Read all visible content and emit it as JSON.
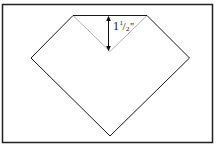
{
  "diagram": {
    "measurement": {
      "whole": "1",
      "numerator": "1",
      "slash": "/",
      "denominator": "2",
      "unit": "\""
    },
    "colors": {
      "frame": "#222222",
      "outline": "#1a1a1a",
      "fold_line": "#b4b4b4",
      "arrow": "#111111",
      "background": "#ffffff"
    }
  }
}
